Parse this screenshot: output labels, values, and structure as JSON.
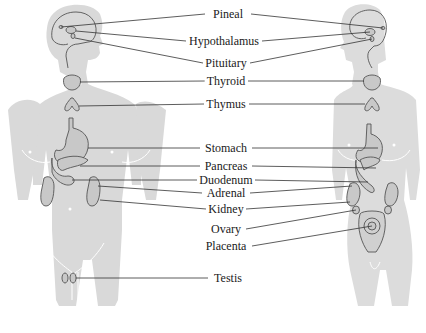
{
  "diagram": {
    "colors": {
      "silhouette": "#d9d9d9",
      "organ_fill": "#c8c8c8",
      "outline": "#555555",
      "leader_line": "#333333",
      "text": "#1a1a1a",
      "background": "#ffffff"
    },
    "figures": [
      {
        "name": "male",
        "side": "left"
      },
      {
        "name": "female",
        "side": "right"
      }
    ],
    "labels": [
      {
        "id": "pineal",
        "text": "Pineal",
        "x": 228,
        "y": 14
      },
      {
        "id": "hypothalamus",
        "text": "Hypothalamus",
        "x": 224,
        "y": 41
      },
      {
        "id": "pituitary",
        "text": "Pituitary",
        "x": 226,
        "y": 63
      },
      {
        "id": "thyroid",
        "text": "Thyroid",
        "x": 226,
        "y": 81
      },
      {
        "id": "thymus",
        "text": "Thymus",
        "x": 226,
        "y": 104
      },
      {
        "id": "stomach",
        "text": "Stomach",
        "x": 226,
        "y": 148
      },
      {
        "id": "pancreas",
        "text": "Pancreas",
        "x": 226,
        "y": 166
      },
      {
        "id": "duodenum",
        "text": "Duodenum",
        "x": 226,
        "y": 180
      },
      {
        "id": "adrenal",
        "text": "Adrenal",
        "x": 226,
        "y": 193
      },
      {
        "id": "kidney",
        "text": "Kidney",
        "x": 226,
        "y": 209
      },
      {
        "id": "ovary",
        "text": "Ovary",
        "x": 226,
        "y": 229
      },
      {
        "id": "placenta",
        "text": "Placenta",
        "x": 226,
        "y": 246
      },
      {
        "id": "testis",
        "text": "Testis",
        "x": 228,
        "y": 278
      }
    ]
  }
}
